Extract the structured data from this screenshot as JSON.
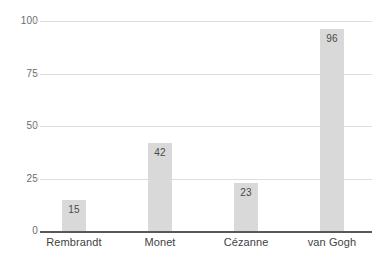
{
  "chart_data": {
    "type": "bar",
    "title": "",
    "subtitle": "",
    "xlabel": "",
    "ylabel": "",
    "categories": [
      "Rembrandt",
      "Monet",
      "Cézanne",
      "van Gogh"
    ],
    "values": [
      15,
      42,
      23,
      96
    ],
    "value_labels": [
      "15",
      "42",
      "23",
      "96"
    ],
    "ylim": [
      0,
      100
    ],
    "yticks": [
      0,
      25,
      50,
      75,
      100
    ],
    "ytick_labels": [
      "0",
      "25",
      "50",
      "75",
      "100"
    ],
    "grid": true,
    "grid_axis": "y",
    "legend": false,
    "legend_position": "none",
    "bar_color": "#d9d9d9",
    "gridline_color": "#dedede",
    "axis_color": "#58585a",
    "value_label_color": "#4a4a4a",
    "tick_label_color": "#6b6b6b",
    "category_label_color": "#3f3f3f",
    "background_color": "#ffffff"
  }
}
